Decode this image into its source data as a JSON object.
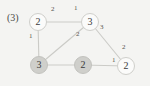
{
  "figure": {
    "step_label": "(3)",
    "background_color": "#f4f4f2",
    "edge_color": "#cbcbc7",
    "node_light_fill": "#fbfbfa",
    "node_filled_fill": "#cfcfcb",
    "node_border_color": "#cfcfcb",
    "text_color": "#3a3a3a"
  },
  "chart_data": {
    "type": "diagram",
    "title": "(3)",
    "xlabel": "",
    "ylabel": "",
    "nodes": [
      {
        "id": "a",
        "label": "2",
        "x": 38,
        "y": 22,
        "state": "light"
      },
      {
        "id": "b",
        "label": "3",
        "x": 90,
        "y": 22,
        "state": "light"
      },
      {
        "id": "c",
        "label": "3",
        "x": 39,
        "y": 65,
        "state": "filled"
      },
      {
        "id": "d",
        "label": "2",
        "x": 83,
        "y": 65,
        "state": "filled"
      },
      {
        "id": "e",
        "label": "2",
        "x": 126,
        "y": 66,
        "state": "light"
      }
    ],
    "edges": [
      {
        "from": "a",
        "to": "b",
        "weights": [
          "2",
          "1"
        ]
      },
      {
        "from": "a",
        "to": "c",
        "weights": [
          "1"
        ]
      },
      {
        "from": "b",
        "to": "c",
        "weights": [
          "2"
        ]
      },
      {
        "from": "b",
        "to": "e",
        "weights": [
          "3",
          "2"
        ]
      },
      {
        "from": "c",
        "to": "d",
        "weights": []
      },
      {
        "from": "d",
        "to": "e",
        "weights": [
          "1"
        ]
      }
    ],
    "edge_labels": [
      {
        "text": "2",
        "x": 51,
        "y": 6
      },
      {
        "text": "1",
        "x": 74,
        "y": 5
      },
      {
        "text": "1",
        "x": 29,
        "y": 33
      },
      {
        "text": "2",
        "x": 76,
        "y": 31
      },
      {
        "text": "3",
        "x": 100,
        "y": 24
      },
      {
        "text": "2",
        "x": 122,
        "y": 44
      },
      {
        "text": "1",
        "x": 112,
        "y": 57
      }
    ]
  }
}
